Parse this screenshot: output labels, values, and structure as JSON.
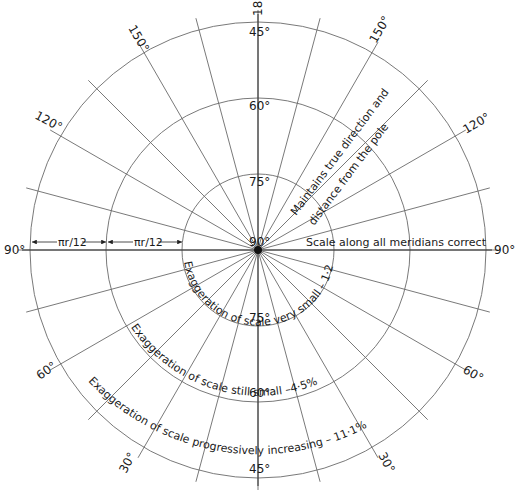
{
  "diagram": {
    "type": "polar azimuthal equidistant projection",
    "center": {
      "x": 258,
      "y": 250
    },
    "center_label": "90°",
    "parallels": [
      {
        "label": "75°",
        "radius": 76
      },
      {
        "label": "60°",
        "radius": 152
      },
      {
        "label": "45°",
        "radius": 228
      }
    ],
    "meridian_interval_deg": 15,
    "meridian_labels": {
      "top": "180°",
      "upper_left": "150°",
      "upper_right": "150°",
      "left_upper": "120°",
      "right_upper": "120°",
      "left": "90°",
      "right": "90°",
      "left_lower": "60°",
      "right_lower": "60°",
      "bottom_left": "30°",
      "bottom_right": "30°"
    },
    "dimension_labels": [
      "πr/12",
      "πr/12"
    ],
    "annotations": {
      "true_direction_1": "Maintains true direction and",
      "true_direction_2": "distance from the pole",
      "meridians_correct": "Scale along all meridians correct",
      "exag_75": "Exaggeration of scale very small – 1·2%",
      "exag_60": "Exaggeration of scale still small –4·5%",
      "exag_45": "Exaggeration of scale progressively increasing – 11·1%"
    }
  }
}
